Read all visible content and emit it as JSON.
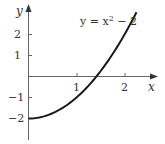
{
  "chart_data": {
    "type": "line",
    "title": "",
    "annotation": "y = x² − 2",
    "function": "y = x^2 - 2",
    "xlabel": "x",
    "ylabel": "y",
    "x_ticks": [
      1,
      2
    ],
    "y_ticks": [
      2,
      1,
      -1,
      -2
    ],
    "xlim": [
      0,
      2.25
    ],
    "ylim": [
      -3,
      3.5
    ],
    "grid": false,
    "legend": "none",
    "series": [
      {
        "name": "y = x^2 - 2",
        "x": [
          0,
          0.25,
          0.5,
          0.75,
          1.0,
          1.25,
          1.414,
          1.5,
          1.75,
          2.0,
          2.25
        ],
        "values": [
          -2,
          -1.94,
          -1.75,
          -1.44,
          -1,
          -0.44,
          0,
          0.25,
          1.06,
          2,
          3.06
        ]
      }
    ],
    "color": "#1a1a1a"
  },
  "labels": {
    "x_axis": "x",
    "y_axis": "y",
    "equation_prefix": "y = x",
    "equation_exp": "2",
    "equation_suffix": " − 2",
    "xtick_1": "1",
    "xtick_2": "2",
    "ytick_2": "2",
    "ytick_1": "1",
    "ytick_m1": "−1",
    "ytick_m2": "−2"
  }
}
